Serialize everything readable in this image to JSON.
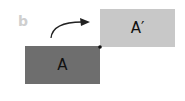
{
  "panel": {
    "label": "b"
  },
  "shapes": {
    "original": {
      "label": "A",
      "color": "#6e6e6e"
    },
    "transformed": {
      "label": "A′",
      "color": "#c8c8c8"
    }
  },
  "arrow": {
    "description": "curved arrow from A toward A′"
  },
  "pivot": {
    "description": "shared corner point"
  }
}
